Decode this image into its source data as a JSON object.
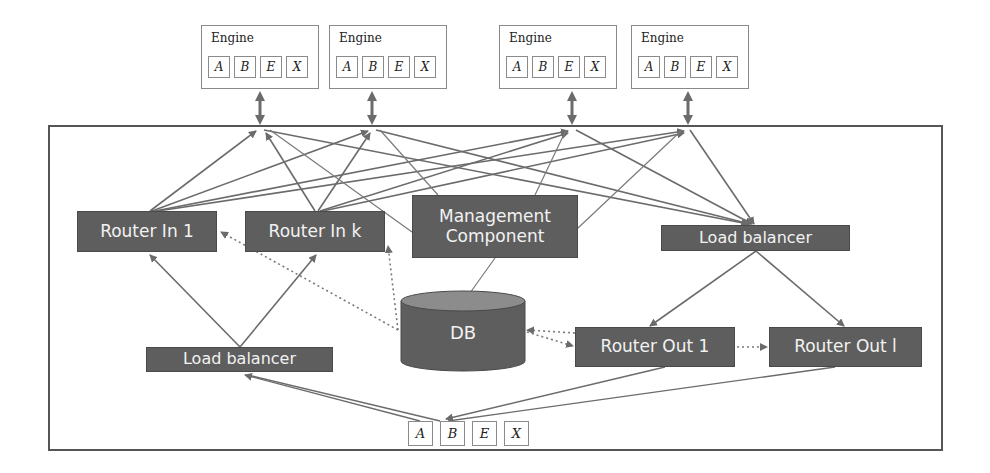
{
  "engines": [
    {
      "title": "Engine",
      "slots": [
        "A",
        "B",
        "E",
        "X"
      ]
    },
    {
      "title": "Engine",
      "slots": [
        "A",
        "B",
        "E",
        "X"
      ]
    },
    {
      "title": "Engine",
      "slots": [
        "A",
        "B",
        "E",
        "X"
      ]
    },
    {
      "title": "Engine",
      "slots": [
        "A",
        "B",
        "E",
        "X"
      ]
    }
  ],
  "nodes": {
    "router_in_1": "Router In 1",
    "router_in_k": "Router In k",
    "management_component_line1": "Management",
    "management_component_line2": "Component",
    "load_balancer_top": "Load balancer",
    "load_balancer_bottom": "Load balancer",
    "db": "DB",
    "router_out_1": "Router Out 1",
    "router_out_l": "Router Out l"
  },
  "message": {
    "slots": [
      "A",
      "B",
      "E",
      "X"
    ]
  },
  "colors": {
    "node_fill": "#5e5e5e",
    "node_text": "#f2f2f2",
    "edge": "#6b6b6b",
    "frame": "#555555",
    "box_border": "#8a8a8a"
  }
}
